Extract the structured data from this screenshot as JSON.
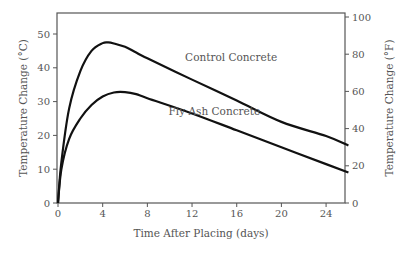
{
  "chart_data": {
    "type": "line",
    "title": "",
    "xlabel": "Time After Placing (days)",
    "ylabel": "Temperature Change (°C)",
    "ylabel_right": "Temperature Change (°F)",
    "xlim": [
      0,
      26
    ],
    "ylim": [
      0,
      55
    ],
    "ylim_right": [
      0,
      100
    ],
    "x_ticks": [
      0,
      4,
      8,
      12,
      16,
      20,
      24
    ],
    "y_ticks": [
      0,
      10,
      20,
      30,
      40,
      50
    ],
    "y_ticks_right": [
      0,
      20,
      40,
      60,
      80,
      100
    ],
    "grid": false,
    "series": [
      {
        "name": "Control Concrete",
        "x": [
          0,
          0.3,
          1,
          2,
          3,
          4,
          4.5,
          5,
          6,
          7,
          8,
          12,
          16,
          20,
          24,
          26
        ],
        "values": [
          0,
          12,
          28,
          39,
          45,
          47.3,
          47.5,
          47.2,
          46.2,
          44.5,
          42.8,
          36.5,
          30.3,
          24,
          19.8,
          17
        ]
      },
      {
        "name": "Fly Ash Concrete",
        "x": [
          0,
          0.3,
          1,
          2,
          3,
          4,
          5,
          6,
          7,
          8,
          12,
          16,
          20,
          24,
          26
        ],
        "values": [
          0,
          10,
          19,
          25,
          29,
          31.5,
          32.7,
          32.8,
          32.2,
          31,
          26.5,
          21.5,
          16.5,
          11.5,
          9
        ]
      }
    ],
    "annotations": [
      {
        "text": "Control Concrete",
        "x": 15.5,
        "y": 42
      },
      {
        "text": "Fly Ash Concrete",
        "x": 14,
        "y": 26
      }
    ]
  }
}
